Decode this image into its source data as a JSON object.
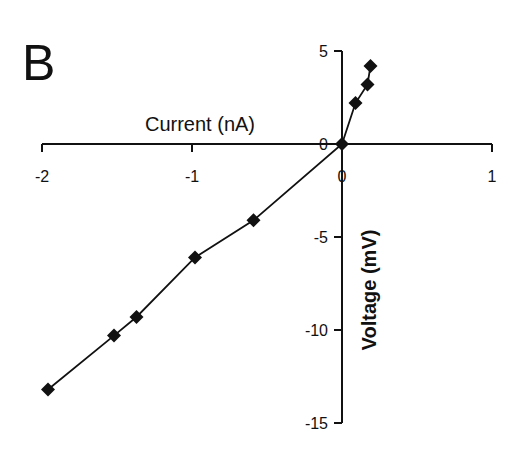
{
  "panel_label": "B",
  "chart_data": {
    "type": "line",
    "title": "",
    "xlabel": "Current (nA)",
    "ylabel": "Voltage (mV)",
    "xlim": [
      -2,
      1
    ],
    "ylim": [
      -15,
      5
    ],
    "x_ticks": [
      "-2",
      "-1",
      "0",
      "1"
    ],
    "y_ticks": [
      "5",
      "0",
      "-5",
      "-10",
      "-15"
    ],
    "grid": false,
    "marker": "diamond",
    "series": [
      {
        "name": "I-V relation",
        "x": [
          -1.96,
          -1.52,
          -1.37,
          -0.98,
          -0.59,
          0.0,
          0.09,
          0.17,
          0.19
        ],
        "y": [
          -13.2,
          -10.3,
          -9.3,
          -6.1,
          -4.1,
          0.0,
          2.2,
          3.2,
          4.2
        ]
      }
    ]
  }
}
